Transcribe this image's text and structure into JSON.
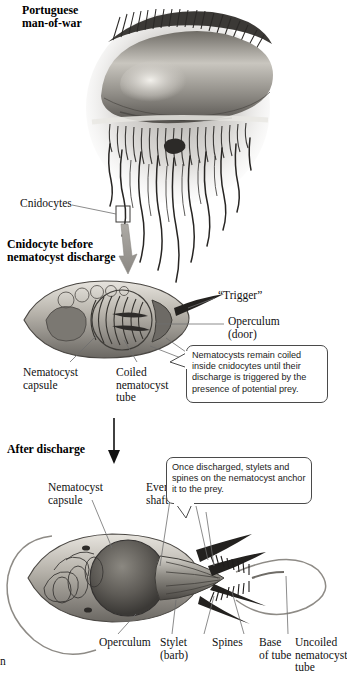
{
  "figure": {
    "organism_label": "Portuguese\nman-of-war",
    "cut_off_text": "n"
  },
  "sections": [
    {
      "id": "organism",
      "heading": "Portuguese\nman-of-war"
    },
    {
      "id": "before",
      "heading": "Cnidocyte before\nnematocyst discharge"
    },
    {
      "id": "after",
      "heading": "After discharge"
    }
  ],
  "labels": {
    "cnidocytes": "Cnidocytes",
    "trigger": "“Trigger”",
    "operculum_door": "Operculum\n(door)",
    "nematocyst_capsule_1": "Nematocyst\ncapsule",
    "coiled_tube": "Coiled\nnematocyst\ntube",
    "nematocyst_capsule_2": "Nematocyst\ncapsule",
    "everted_shaft": "Everted\nshaft",
    "operculum": "Operculum",
    "stylet": "Stylet\n(barb)",
    "spines": "Spines",
    "base_of_tube": "Base\nof tube",
    "uncoiled_tube": "Uncoiled\nnematocyst\ntube"
  },
  "callouts": [
    {
      "id": "coiled-callout",
      "text": "Nematocysts remain coiled inside cnidocytes until their discharge is triggered by the presence of potential prey."
    },
    {
      "id": "anchor-callout",
      "text": "Once discharged, stylets and spines on the nematocyst anchor it to the prey."
    }
  ],
  "colors": {
    "ink": "#111111",
    "callout_border": "#4a4a4a",
    "leader_line": "#6e6e6e",
    "arrow_gray": "#9a9a9a",
    "arrow_black": "#111111",
    "tissue_light": "#d8d5cf",
    "tissue_mid": "#9a968e",
    "tissue_dark": "#4d4a46",
    "water_haze": "#bfbdb8",
    "background": "#ffffff"
  }
}
